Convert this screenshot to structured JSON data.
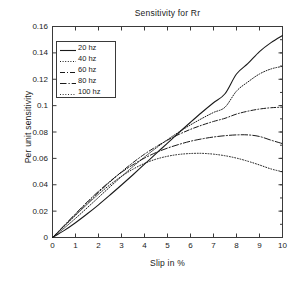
{
  "chart_data": {
    "type": "line",
    "title": "Sensitivity for Rr",
    "xlabel": "Slip in %",
    "ylabel": "Per unit sensitivity",
    "xlim": [
      0,
      10
    ],
    "ylim": [
      0,
      0.16
    ],
    "grid": false,
    "legend_position": "upper left",
    "xticks": [
      0,
      1,
      2,
      3,
      4,
      5,
      6,
      7,
      8,
      9,
      10
    ],
    "xtick_labels": [
      "0",
      "1",
      "2",
      "3",
      "4",
      "5",
      "6",
      "7",
      "8",
      "9",
      "10"
    ],
    "yticks": [
      0,
      0.02,
      0.04,
      0.06,
      0.08,
      0.1,
      0.12,
      0.14,
      0.16
    ],
    "ytick_labels": [
      "0",
      "0.02",
      "0.04",
      "0.06",
      "0.08",
      "0.1",
      "0.12",
      "0.14",
      "0.16"
    ],
    "x": [
      0,
      0.5,
      1,
      1.5,
      2,
      2.5,
      3,
      3.5,
      4,
      4.5,
      5,
      5.5,
      6,
      6.5,
      7,
      7.5,
      8,
      8.5,
      9,
      9.5,
      10
    ],
    "series": [
      {
        "name": "20 hz",
        "style": "solid",
        "color": "#1a1a1a",
        "values": [
          0,
          0.0052,
          0.0112,
          0.0178,
          0.0248,
          0.0322,
          0.0398,
          0.0476,
          0.0556,
          0.0636,
          0.0716,
          0.0796,
          0.0874,
          0.095,
          0.1022,
          0.109,
          0.124,
          0.132,
          0.141,
          0.1478,
          0.1532
        ]
      },
      {
        "name": "40 hz",
        "style": "dotted",
        "color": "#1a1a1a",
        "values": [
          0,
          0.007,
          0.0145,
          0.0224,
          0.0304,
          0.0384,
          0.0462,
          0.0538,
          0.061,
          0.0678,
          0.0742,
          0.08,
          0.0854,
          0.0903,
          0.0948,
          0.0988,
          0.111,
          0.118,
          0.124,
          0.1278,
          0.1298
        ]
      },
      {
        "name": "60 hz",
        "style": "dashdot",
        "color": "#1a1a1a",
        "values": [
          0,
          0.0086,
          0.0172,
          0.0258,
          0.0342,
          0.0422,
          0.0498,
          0.0568,
          0.0632,
          0.0688,
          0.0738,
          0.0782,
          0.082,
          0.0852,
          0.088,
          0.0904,
          0.0936,
          0.0958,
          0.0974,
          0.0984,
          0.0988
        ]
      },
      {
        "name": "80 hz",
        "style": "dashdot-long",
        "color": "#1a1a1a",
        "values": [
          0,
          0.009,
          0.018,
          0.0268,
          0.035,
          0.0426,
          0.0494,
          0.0552,
          0.0602,
          0.0644,
          0.0678,
          0.0706,
          0.073,
          0.0748,
          0.0762,
          0.0772,
          0.0778,
          0.0778,
          0.0766,
          0.0738,
          0.0712
        ]
      },
      {
        "name": "100 hz",
        "style": "dotted-fine",
        "color": "#1a1a1a",
        "values": [
          0,
          0.0084,
          0.0168,
          0.025,
          0.0328,
          0.04,
          0.0464,
          0.0518,
          0.0562,
          0.0594,
          0.0616,
          0.063,
          0.0637,
          0.0638,
          0.0632,
          0.062,
          0.0602,
          0.0578,
          0.055,
          0.052,
          0.0498
        ]
      }
    ]
  },
  "legend": {
    "items": [
      {
        "label": "20 hz"
      },
      {
        "label": "40 hz"
      },
      {
        "label": "60 hz"
      },
      {
        "label": "80 hz"
      },
      {
        "label": "100 hz"
      }
    ]
  }
}
